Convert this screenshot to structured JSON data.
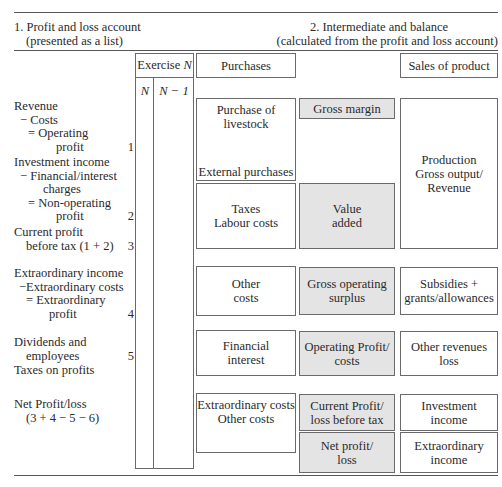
{
  "section1": {
    "title_line1": "1. Profit and loss account",
    "title_line2": "(presented as a list)"
  },
  "section2": {
    "title_line1": "2. Intermediate and balance",
    "title_line2": "(calculated from the profit and loss account)"
  },
  "exercise": {
    "header_text": "Exercise ",
    "header_var": "N",
    "col1": "N",
    "col2": "N − 1"
  },
  "list": {
    "group1": {
      "lines": [
        "Revenue",
        "− Costs",
        "= Operating",
        "profit"
      ],
      "number": "1"
    },
    "group2": {
      "lines": [
        "Investment income",
        "− Financial/interest",
        "charges",
        "= Non-operating",
        "profit"
      ],
      "number": "2"
    },
    "group3": {
      "lines": [
        "Current profit",
        "before tax (1 + 2)"
      ],
      "number": "3"
    },
    "group4": {
      "lines": [
        "Extraordinary income",
        "−Extraordinary costs",
        "= Extraordinary",
        "profit"
      ],
      "number": "4"
    },
    "group5": {
      "lines": [
        "Dividends and",
        "employees"
      ],
      "number": "5"
    },
    "group6": {
      "lines": [
        "Taxes on profits"
      ]
    },
    "group7": {
      "lines": [
        "Net Profit/loss",
        "(3 + 4 − 5 − 6)"
      ]
    }
  },
  "costs_column": {
    "purchases": "Purchases",
    "livestock": [
      "Purchase of",
      "livestock"
    ],
    "external": "External purchases",
    "taxes_labour": [
      "Taxes",
      "Labour costs"
    ],
    "other_costs": [
      "Other",
      "costs"
    ],
    "financial_interest": [
      "Financial",
      "interest"
    ],
    "extraordinary_other": [
      "Extraordinary costs",
      "Other costs"
    ]
  },
  "balances_column": {
    "gross_margin": [
      "Gross margin"
    ],
    "value_added": [
      "Value",
      "added"
    ],
    "gross_operating_surplus": [
      "Gross operating",
      "surplus"
    ],
    "operating_profit": [
      "Operating Profit/",
      "costs"
    ],
    "current_profit": [
      "Current Profit/",
      "loss before tax"
    ],
    "net_profit": [
      "Net profit/",
      "loss"
    ]
  },
  "revenues_column": {
    "sales": "Sales of product",
    "production": [
      "Production",
      "Gross output/",
      "Revenue"
    ],
    "subsidies": [
      "Subsidies +",
      "grants/allowances"
    ],
    "other_revenues": [
      "Other revenues",
      "loss"
    ],
    "investment_income": [
      "Investment",
      "income"
    ],
    "extraordinary_income": [
      "Extraordinary",
      "income"
    ]
  },
  "colors": {
    "shaded_box": "#e4e4e4",
    "border": "#6a6a6a",
    "text": "#2a2a2a"
  }
}
